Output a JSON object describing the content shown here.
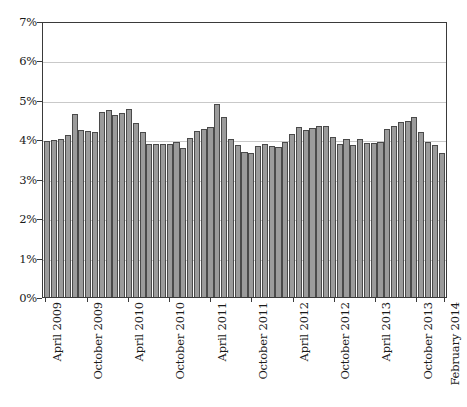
{
  "chart_data": {
    "type": "bar",
    "title": "",
    "subtitle": "",
    "xlabel": "",
    "ylabel": "",
    "ylim": [
      0,
      7
    ],
    "ytick_values": [
      0,
      1,
      2,
      3,
      4,
      5,
      6,
      7
    ],
    "ytick_labels": [
      "0%",
      "1%",
      "2%",
      "3%",
      "4%",
      "5%",
      "6%",
      "7%"
    ],
    "grid": true,
    "legend": null,
    "bar_color": "#9b9b9b",
    "bar_edge_color": "#4a4a4a",
    "axis_color": "#3a3a3a",
    "grid_color": "#c9c9c9",
    "xtick_labels": [
      "April 2009",
      "October 2009",
      "April 2010",
      "October 2010",
      "April 2011",
      "October 2011",
      "April 2012",
      "October 2012",
      "April 2013",
      "October 2013",
      "February 2014"
    ],
    "xtick_indices": [
      0,
      6,
      12,
      18,
      24,
      30,
      36,
      42,
      48,
      54,
      58
    ],
    "categories": [
      "April 2009",
      "May 2009",
      "June 2009",
      "July 2009",
      "August 2009",
      "September 2009",
      "October 2009",
      "November 2009",
      "December 2009",
      "January 2010",
      "February 2010",
      "March 2010",
      "April 2010",
      "May 2010",
      "June 2010",
      "July 2010",
      "August 2010",
      "September 2010",
      "October 2010",
      "November 2010",
      "December 2010",
      "January 2011",
      "February 2011",
      "March 2011",
      "April 2011",
      "May 2011",
      "June 2011",
      "July 2011",
      "August 2011",
      "September 2011",
      "October 2011",
      "November 2011",
      "December 2011",
      "January 2012",
      "February 2012",
      "March 2012",
      "April 2012",
      "May 2012",
      "June 2012",
      "July 2012",
      "August 2012",
      "September 2012",
      "October 2012",
      "November 2012",
      "December 2012",
      "January 2013",
      "February 2013",
      "March 2013",
      "April 2013",
      "May 2013",
      "June 2013",
      "July 2013",
      "August 2013",
      "September 2013",
      "October 2013",
      "November 2013",
      "December 2013",
      "January 2014",
      "February 2014"
    ],
    "values": [
      3.95,
      3.98,
      4.02,
      4.1,
      4.64,
      4.24,
      4.22,
      4.18,
      4.68,
      4.75,
      4.62,
      4.66,
      4.78,
      4.41,
      4.19,
      3.89,
      3.88,
      3.88,
      3.89,
      3.94,
      3.79,
      4.03,
      4.21,
      4.27,
      4.3,
      4.9,
      4.57,
      4.01,
      3.85,
      3.68,
      3.65,
      3.82,
      3.88,
      3.82,
      3.81,
      3.93,
      4.13,
      4.31,
      4.23,
      4.28,
      4.33,
      4.35,
      4.05,
      3.89,
      4.0,
      3.85,
      4.02,
      3.9,
      3.9,
      3.92,
      4.26,
      4.35,
      4.44,
      4.47,
      4.57,
      4.18,
      3.93,
      3.86,
      3.65
    ]
  }
}
